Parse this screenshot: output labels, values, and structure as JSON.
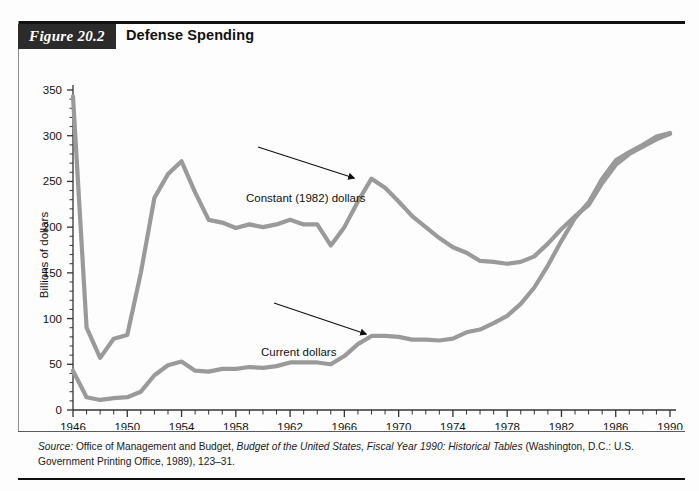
{
  "figure": {
    "tag": "Figure 20.2",
    "title": "Defense Spending"
  },
  "source": {
    "prefix": "Source:",
    "line1_a": " Office of Management and Budget, ",
    "line1_italic": "Budget of the United States, Fiscal Year 1990: Historical",
    "line2_italic": "Tables",
    "line2_b": " (Washington, D.C.: U.S. Government Printing Office, 1989), 123–31."
  },
  "annotations": {
    "constant": "Constant (1982) dollars",
    "current": "Current dollars"
  },
  "colors": {
    "line": "#9a9a9a",
    "axis": "#333333",
    "text": "#111111",
    "tag_background": "#2b2b2b",
    "rule": "#111111"
  },
  "chart_data": {
    "type": "line",
    "title": "Defense Spending",
    "xlabel": "Year",
    "ylabel": "Billions of dollars",
    "xlim": [
      1946,
      1990
    ],
    "ylim": [
      0,
      350
    ],
    "ytick_step": 50,
    "yticks": [
      0,
      50,
      100,
      150,
      200,
      250,
      300,
      350
    ],
    "xticks": [
      1946,
      1950,
      1954,
      1958,
      1962,
      1966,
      1970,
      1974,
      1978,
      1982,
      1986,
      1990
    ],
    "xtick_minor_step": 1,
    "grid": false,
    "legend": "annotations-inline",
    "x": [
      1946,
      1947,
      1948,
      1949,
      1950,
      1951,
      1952,
      1953,
      1954,
      1955,
      1956,
      1957,
      1958,
      1959,
      1960,
      1961,
      1962,
      1963,
      1964,
      1965,
      1966,
      1967,
      1968,
      1969,
      1970,
      1971,
      1972,
      1973,
      1974,
      1975,
      1976,
      1977,
      1978,
      1979,
      1980,
      1981,
      1982,
      1983,
      1984,
      1985,
      1986,
      1987,
      1988,
      1989,
      1990
    ],
    "series": [
      {
        "name": "Constant (1982) dollars",
        "values": [
          343,
          90,
          57,
          78,
          82,
          150,
          232,
          258,
          272,
          238,
          208,
          205,
          199,
          203,
          200,
          203,
          208,
          203,
          203,
          180,
          200,
          228,
          253,
          243,
          228,
          212,
          200,
          188,
          178,
          172,
          163,
          162,
          160,
          162,
          168,
          182,
          198,
          212,
          224,
          248,
          268,
          280,
          288,
          296,
          302
        ]
      },
      {
        "name": "Current dollars",
        "values": [
          43,
          14,
          11,
          13,
          14,
          20,
          38,
          49,
          53,
          43,
          42,
          45,
          45,
          47,
          46,
          48,
          52,
          52,
          52,
          50,
          59,
          72,
          81,
          81,
          80,
          77,
          77,
          76,
          78,
          85,
          88,
          95,
          103,
          116,
          134,
          158,
          185,
          210,
          227,
          253,
          273,
          282,
          290,
          299,
          303
        ]
      }
    ],
    "notes": {
      "crossover_year": 1982,
      "peak_constant_year": 1954,
      "peak_constant_value": 272,
      "start_constant_value": 343,
      "min_constant_year": 1948,
      "min_constant_value": 57,
      "end_constant_value": 302,
      "end_current_value": 246
    }
  }
}
